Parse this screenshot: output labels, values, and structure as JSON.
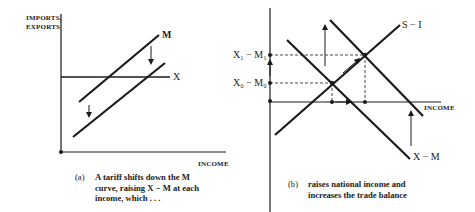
{
  "panel_a": {
    "y_axis_label_line1": "IMPORTS,",
    "y_axis_label_line2": "EXPORTS",
    "x_axis_label": "INCOME",
    "curve_m_label": "M",
    "curve_x_label": "X",
    "caption_tag": "(a)",
    "caption_line1": "A tariff shifts down the M",
    "caption_line2": "curve, raising X − M at each",
    "caption_line3": "income, which  . . ."
  },
  "panel_b": {
    "y_tick_upper": "X₁ − M₁",
    "y_tick_lower": "X₀ − M₀",
    "x_axis_label": "INCOME",
    "curve_si_label": "S − I",
    "curve_xm_label": "X − M",
    "caption_tag": "(b)",
    "caption_line1": "raises national income and",
    "caption_line2": "increases the trade balance"
  },
  "colors": {
    "ink": "#1a1a1a",
    "background": "#ffffff"
  }
}
